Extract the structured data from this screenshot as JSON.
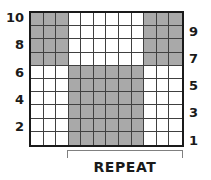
{
  "chart_data": {
    "type": "heatmap",
    "title": "",
    "xlabel": "",
    "ylabel": "",
    "columns": 12,
    "rows": 10,
    "legend": [],
    "row_labels_left": [
      "10",
      "",
      "8",
      "",
      "6",
      "",
      "4",
      "",
      "2",
      ""
    ],
    "row_labels_right": [
      "",
      "9",
      "",
      "7",
      "",
      "5",
      "",
      "3",
      "",
      "1"
    ],
    "colors": {
      "filled": "#a9a9a9",
      "empty": "#ffffff",
      "grid_line": "#404040",
      "border": "#1a1a1a",
      "bracket": "#808080",
      "text": "#1a1a1a"
    },
    "matrix": [
      [
        1,
        1,
        1,
        0,
        0,
        0,
        0,
        0,
        0,
        1,
        1,
        1
      ],
      [
        1,
        1,
        1,
        0,
        0,
        0,
        0,
        0,
        0,
        1,
        1,
        1
      ],
      [
        1,
        1,
        1,
        0,
        0,
        0,
        0,
        0,
        0,
        1,
        1,
        1
      ],
      [
        1,
        1,
        1,
        0,
        0,
        0,
        0,
        0,
        0,
        1,
        1,
        1
      ],
      [
        0,
        0,
        0,
        1,
        1,
        1,
        1,
        1,
        1,
        0,
        0,
        0
      ],
      [
        0,
        0,
        0,
        1,
        1,
        1,
        1,
        1,
        1,
        0,
        0,
        0
      ],
      [
        0,
        0,
        0,
        1,
        1,
        1,
        1,
        1,
        1,
        0,
        0,
        0
      ],
      [
        0,
        0,
        0,
        1,
        1,
        1,
        1,
        1,
        1,
        0,
        0,
        0
      ],
      [
        0,
        0,
        0,
        1,
        1,
        1,
        1,
        1,
        1,
        0,
        0,
        0
      ],
      [
        0,
        0,
        0,
        1,
        1,
        1,
        1,
        1,
        1,
        0,
        0,
        0
      ]
    ],
    "repeat": {
      "label": "REPEAT",
      "start_column": 4,
      "end_column": 12
    }
  }
}
